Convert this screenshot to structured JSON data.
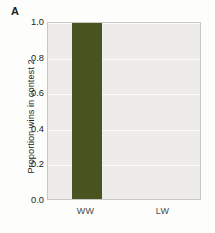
{
  "panel": {
    "label": "A"
  },
  "colors": {
    "bar": "#4A5420",
    "plot_background": "#EDECEA",
    "gridline": "#FBFBFA",
    "axis_frame": "#C9C7C4",
    "text": "#231F20",
    "page_background": "#FDFDFC"
  },
  "chart_data": {
    "type": "bar",
    "title": "",
    "subtitle": "",
    "xlabel": "",
    "ylabel": "Proportion wins in contest 2",
    "categories": [
      "WW",
      "LW"
    ],
    "values": [
      1.0,
      0.0
    ],
    "series": [
      {
        "name": "Proportion wins in contest 2",
        "values": [
          1.0,
          0.0
        ]
      }
    ],
    "ylim": [
      0.0,
      1.0
    ],
    "yticks": [
      0.0,
      0.2,
      0.4,
      0.6,
      0.8,
      1.0
    ],
    "ytick_labels": [
      "0.0",
      "0.2",
      "0.4",
      "0.6",
      "0.8",
      "1.0"
    ],
    "xtick_labels": [
      "WW",
      "LW"
    ],
    "grid": "horizontal",
    "legend": "none",
    "annotations": [
      "A"
    ]
  }
}
